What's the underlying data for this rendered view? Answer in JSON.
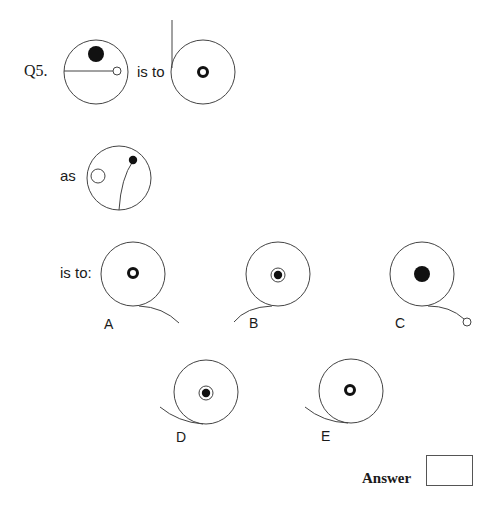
{
  "question": {
    "number": "Q5.",
    "connector_1": "is to",
    "connector_2": "as",
    "connector_3": "is to:"
  },
  "options": [
    {
      "label": "A",
      "description": "large circle with thick ring in center, tail curving down-right from bottom"
    },
    {
      "label": "B",
      "description": "large circle with black dot inside thin ring, tail curving down-left from bottom"
    },
    {
      "label": "C",
      "description": "large circle with solid black dot, tail curving down-right ending in small open circle"
    },
    {
      "label": "D",
      "description": "large circle with black dot inside thin ring, tail entering from left to bottom"
    },
    {
      "label": "E",
      "description": "large circle with thick ring in center, tail entering from left to bottom"
    }
  ],
  "figures": {
    "first": "circle with black dot near top and horizontal radius line ending in small open circle",
    "second": "circle with thick ring in center and vertical line extending up from left edge",
    "third": "circle with small open circle at left and curved line from bottom to black dot at upper right"
  },
  "answer": {
    "label": "Answer",
    "value": ""
  },
  "colors": {
    "stroke": "#444444",
    "fill": "#111111",
    "background": "#ffffff"
  }
}
